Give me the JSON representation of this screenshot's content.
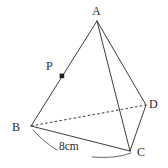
{
  "figure": {
    "type": "geometry-diagram",
    "background_color": "#ffffff",
    "stroke_color": "#3c3c42",
    "label_color": "#2a2a30",
    "vertices": [
      {
        "id": "A",
        "label": "A",
        "x": 97,
        "y": 21,
        "label_x": 92,
        "label_y": 5,
        "dot": false
      },
      {
        "id": "B",
        "label": "B",
        "x": 31,
        "y": 126,
        "label_x": 12,
        "label_y": 121,
        "dot": false
      },
      {
        "id": "C",
        "label": "C",
        "x": 130,
        "y": 151,
        "label_x": 137,
        "label_y": 146,
        "dot": false
      },
      {
        "id": "D",
        "label": "D",
        "x": 146,
        "y": 105,
        "label_x": 149,
        "label_y": 98,
        "dot": false
      },
      {
        "id": "P",
        "label": "P",
        "x": 62,
        "y": 76,
        "label_x": 46,
        "label_y": 60,
        "dot": true
      }
    ],
    "edges": [
      {
        "from": "A",
        "to": "B",
        "style": "solid"
      },
      {
        "from": "A",
        "to": "C",
        "style": "solid"
      },
      {
        "from": "A",
        "to": "D",
        "style": "solid"
      },
      {
        "from": "B",
        "to": "C",
        "style": "solid"
      },
      {
        "from": "C",
        "to": "D",
        "style": "solid"
      },
      {
        "from": "B",
        "to": "D",
        "style": "dashed"
      }
    ],
    "measurement": {
      "label": "8cm",
      "value": 8,
      "unit": "cm",
      "applies_to_edge": "BC",
      "label_x": 59,
      "label_y": 141,
      "arc": {
        "start_x": 33,
        "start_y": 130,
        "ctrl_x": 80,
        "ctrl_y": 172,
        "end_x": 131,
        "end_y": 153,
        "gap_start_x": 57,
        "gap_start_y": 150,
        "gap_end_x": 92,
        "gap_end_y": 157
      }
    }
  }
}
